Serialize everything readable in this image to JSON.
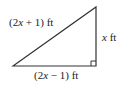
{
  "diagram": {
    "type": "right-triangle",
    "labels": {
      "hypotenuse": {
        "pre": "(2",
        "var": "x",
        "post": " + 1) ft"
      },
      "vertical": {
        "pre": "",
        "var": "x",
        "post": " ft"
      },
      "base": {
        "pre": "(2",
        "var": "x",
        "post": " − 1) ft"
      }
    },
    "stroke_color": "#333333"
  }
}
